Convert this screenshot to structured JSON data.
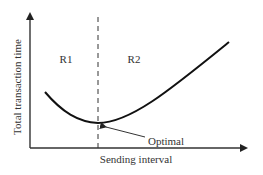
{
  "diagram": {
    "type": "concept-curve",
    "y_axis_label": "Total transaction time",
    "x_axis_label": "Sending interval",
    "regions": [
      {
        "label": "R1",
        "side": "left"
      },
      {
        "label": "R2",
        "side": "right"
      }
    ],
    "annotation": {
      "label": "Optimal",
      "points_to": "curve-minimum"
    },
    "colors": {
      "line": "#111111",
      "axis": "#333333",
      "text": "#333333",
      "background": "#ffffff"
    }
  }
}
